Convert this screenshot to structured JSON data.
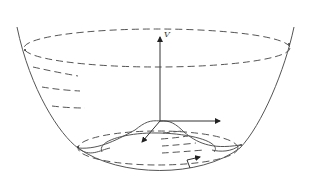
{
  "diagram": {
    "type": "mexican-hat-potential",
    "axis_label_vertical": "V",
    "colors": {
      "line": "#555555",
      "axis": "#333333",
      "background": "#ffffff"
    },
    "elements": [
      "paraboloid-bowl",
      "top-rim-ellipse-dashed",
      "level-contour-dashes",
      "vertical-axis-V",
      "horizontal-axis-right",
      "horizontal-axis-front",
      "central-hump",
      "minimum-ring-dashed",
      "inner-ring",
      "tangent-arrow"
    ]
  }
}
